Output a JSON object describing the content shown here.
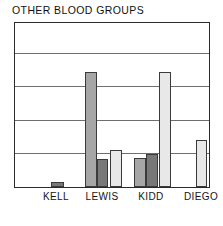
{
  "chart_data": {
    "type": "bar",
    "title": "OTHER BLOOD GROUPS",
    "xlabel": "",
    "ylabel": "",
    "categories": [
      "KELL",
      "LEWIS",
      "KIDD",
      "DIEGO"
    ],
    "ylim": [
      0,
      5
    ],
    "grid": true,
    "gridline_values": [
      1,
      2,
      3,
      4
    ],
    "legend": "none",
    "legend_position": "none",
    "series": [
      {
        "name": "series-1",
        "color": "#a6a6a6",
        "values": [
          null,
          3.45,
          0.87,
          null
        ]
      },
      {
        "name": "series-2",
        "color": "#787878",
        "values": [
          0.16,
          0.83,
          1.0,
          null
        ]
      },
      {
        "name": "series-3",
        "color": "#e8e8e8",
        "values": [
          null,
          1.12,
          3.45,
          1.42
        ]
      }
    ],
    "bars": [
      {
        "category": "KELL",
        "series": "series-2",
        "value": 0.16,
        "color": "#787878",
        "x": 36,
        "width": 13
      },
      {
        "category": "LEWIS",
        "series": "series-1",
        "value": 3.45,
        "color": "#a6a6a6",
        "x": 70,
        "width": 12
      },
      {
        "category": "LEWIS",
        "series": "series-2",
        "value": 0.83,
        "color": "#787878",
        "x": 82,
        "width": 11
      },
      {
        "category": "LEWIS",
        "series": "series-3",
        "value": 1.12,
        "color": "#e8e8e8",
        "x": 95,
        "width": 12
      },
      {
        "category": "KIDD",
        "series": "series-1",
        "value": 0.87,
        "color": "#a6a6a6",
        "x": 119,
        "width": 12
      },
      {
        "category": "KIDD",
        "series": "series-2",
        "value": 1.0,
        "color": "#787878",
        "x": 131,
        "width": 12
      },
      {
        "category": "KIDD",
        "series": "series-3",
        "value": 3.45,
        "color": "#e8e8e8",
        "x": 144,
        "width": 12
      },
      {
        "category": "DIEGO",
        "series": "series-3",
        "value": 1.42,
        "color": "#e8e8e8",
        "x": 181,
        "width": 11
      }
    ],
    "category_label_x": [
      42,
      88,
      137,
      187
    ],
    "colors": {
      "frame": "#2b2b2b",
      "gridline": "#6f6f6f",
      "bar_outline": "#3a3a3a",
      "background": "#ffffff",
      "text": "#141414"
    }
  }
}
